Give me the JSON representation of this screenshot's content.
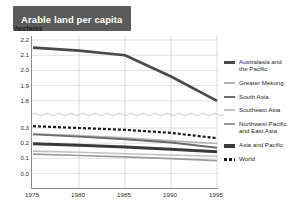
{
  "title": "Arable land per capita",
  "unit_label": "hectares",
  "chart_data": {
    "type": "line",
    "title": "Arable land per capita",
    "xlabel": "",
    "ylabel": "hectares",
    "grid": true,
    "legend_position": "right",
    "broken_axis": true,
    "axis_note": "Y axis is broken: upper panel spans 1.8-2.2, lower panel spans 0.0-0.3",
    "x": [
      1975,
      1980,
      1985,
      1990,
      1995
    ],
    "xtick_labels": [
      "1975",
      "1980",
      "1985",
      "1990",
      "1995"
    ],
    "ytick_labels_upper": [
      "2.2",
      "2.1",
      "2.0",
      "1.9",
      "1.8"
    ],
    "ytick_labels_lower": [
      "0.3",
      "0.2",
      "0.1",
      "0.0"
    ],
    "ylim_upper": [
      1.8,
      2.2
    ],
    "ylim_lower": [
      0.0,
      0.3
    ],
    "series": [
      {
        "name": "Australasia and\nthe Pacific",
        "values": [
          2.15,
          2.13,
          2.1,
          1.96,
          1.8
        ],
        "color": "#4a4a4a",
        "width": 2.6,
        "dash": "none",
        "panel": "upper"
      },
      {
        "name": "Greater Mekong",
        "values": [
          0.262,
          0.25,
          0.236,
          0.215,
          0.198
        ],
        "color": "#b4b4b4",
        "width": 1.7,
        "dash": "none",
        "panel": "lower"
      },
      {
        "name": "South Asia",
        "values": [
          0.258,
          0.243,
          0.226,
          0.205,
          0.17
        ],
        "color": "#6b6b6b",
        "width": 1.9,
        "dash": "none",
        "panel": "lower"
      },
      {
        "name": "Southeast Asia",
        "values": [
          0.148,
          0.14,
          0.131,
          0.122,
          0.114
        ],
        "color": "#c2c2c2",
        "width": 1.6,
        "dash": "none",
        "panel": "lower"
      },
      {
        "name": "Northwest Pacific\nand East Asia",
        "values": [
          0.128,
          0.119,
          0.11,
          0.098,
          0.086
        ],
        "color": "#9a9a9a",
        "width": 1.7,
        "dash": "none",
        "panel": "lower"
      },
      {
        "name": "Asia and Pacific",
        "values": [
          0.196,
          0.186,
          0.175,
          0.16,
          0.143
        ],
        "color": "#3a3a3a",
        "width": 3.0,
        "dash": "none",
        "panel": "lower"
      },
      {
        "name": "World",
        "values": [
          0.312,
          0.3,
          0.288,
          0.268,
          0.233
        ],
        "color": "#1a1a1a",
        "width": 2.2,
        "dash": "3,2",
        "panel": "lower"
      }
    ]
  },
  "legend": {
    "items": [
      {
        "label": "Australasia and\nthe Pacific",
        "color": "#4a4a4a",
        "height": 2.6,
        "dashed": false,
        "gap": false
      },
      {
        "label": "Greater Mekong",
        "color": "#b4b4b4",
        "height": 1.7,
        "dashed": false,
        "gap": false
      },
      {
        "label": "South Asia",
        "color": "#6b6b6b",
        "height": 2.2,
        "dashed": false,
        "gap": false
      },
      {
        "label": "Southeast Asia",
        "color": "#c2c2c2",
        "height": 1.6,
        "dashed": false,
        "gap": false
      },
      {
        "label": "Northwest Pacific\nand East Asia",
        "color": "#9a9a9a",
        "height": 1.9,
        "dashed": false,
        "gap": false
      },
      {
        "label": "Asia and Pacific",
        "color": "#3a3a3a",
        "height": 3.2,
        "dashed": false,
        "gap": true
      },
      {
        "label": "World",
        "color": "#1a1a1a",
        "height": 2.4,
        "dashed": true,
        "gap": false
      }
    ]
  }
}
